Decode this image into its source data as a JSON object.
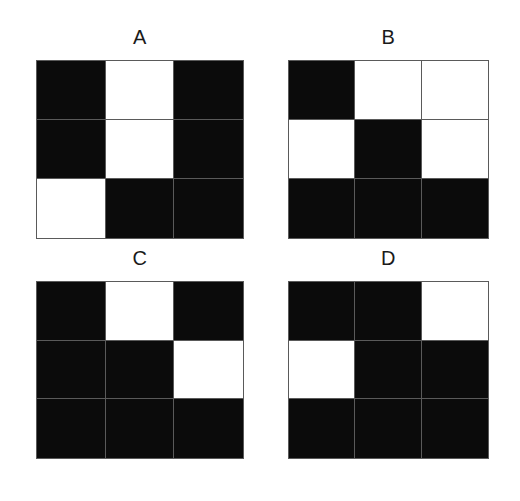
{
  "figure": {
    "background_color": "#ffffff",
    "label_color": "#1a1a1a",
    "cell_black": "#0b0b0b",
    "cell_white": "#ffffff",
    "grid_line_color": "#4a4a4a"
  },
  "panels": [
    {
      "id": "A",
      "label": "A",
      "rows": 3,
      "cols": 3,
      "cells": [
        [
          "black",
          "white",
          "black"
        ],
        [
          "black",
          "white",
          "black"
        ],
        [
          "white",
          "black",
          "black"
        ]
      ]
    },
    {
      "id": "B",
      "label": "B",
      "rows": 3,
      "cols": 3,
      "cells": [
        [
          "black",
          "white",
          "white"
        ],
        [
          "white",
          "black",
          "white"
        ],
        [
          "black",
          "black",
          "black"
        ]
      ]
    },
    {
      "id": "C",
      "label": "C",
      "rows": 3,
      "cols": 3,
      "cells": [
        [
          "black",
          "white",
          "black"
        ],
        [
          "black",
          "black",
          "white"
        ],
        [
          "black",
          "black",
          "black"
        ]
      ]
    },
    {
      "id": "D",
      "label": "D",
      "rows": 3,
      "cols": 3,
      "cells": [
        [
          "black",
          "black",
          "white"
        ],
        [
          "white",
          "black",
          "black"
        ],
        [
          "black",
          "black",
          "black"
        ]
      ]
    }
  ],
  "chart_data": {
    "type": "heatmap",
    "title": "",
    "xlabel": "",
    "ylabel": "",
    "grid": true,
    "legend": "none",
    "panel_labels": [
      "A",
      "B",
      "C",
      "D"
    ],
    "layout": "2x2 panels, each a 3x3 binary grid",
    "value_map": {
      "black": 1,
      "white": 0
    },
    "panels": [
      {
        "name": "A",
        "values": [
          [
            1,
            0,
            1
          ],
          [
            1,
            0,
            1
          ],
          [
            0,
            1,
            1
          ]
        ]
      },
      {
        "name": "B",
        "values": [
          [
            1,
            0,
            0
          ],
          [
            0,
            1,
            0
          ],
          [
            1,
            1,
            1
          ]
        ]
      },
      {
        "name": "C",
        "values": [
          [
            1,
            0,
            1
          ],
          [
            1,
            1,
            0
          ],
          [
            1,
            1,
            1
          ]
        ]
      },
      {
        "name": "D",
        "values": [
          [
            1,
            1,
            0
          ],
          [
            0,
            1,
            1
          ],
          [
            1,
            1,
            1
          ]
        ]
      }
    ]
  }
}
